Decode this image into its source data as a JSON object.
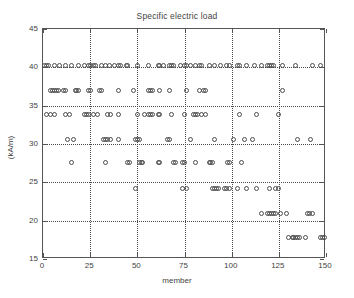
{
  "chart_data": {
    "type": "scatter",
    "title": "Specific electric load",
    "xlabel": "member",
    "ylabel": "(kA/m)",
    "xlim": [
      0,
      150
    ],
    "ylim": [
      15,
      45
    ],
    "xticks": [
      0,
      25,
      50,
      75,
      100,
      125,
      150
    ],
    "yticks": [
      15,
      20,
      25,
      30,
      35,
      40,
      45
    ],
    "grid": true,
    "grid_style": "dotted",
    "legend": null,
    "marker": "open-circle",
    "series": [
      {
        "name": "Specific electric load",
        "points": [
          [
            1,
            40.3
          ],
          [
            2,
            40.3
          ],
          [
            3,
            40.3
          ],
          [
            6,
            40.3
          ],
          [
            9,
            40.3
          ],
          [
            12,
            40.3
          ],
          [
            15,
            40.3
          ],
          [
            19,
            40.3
          ],
          [
            22,
            40.3
          ],
          [
            24,
            40.3
          ],
          [
            25,
            40.3
          ],
          [
            27,
            40.3
          ],
          [
            28,
            40.3
          ],
          [
            31,
            40.3
          ],
          [
            33,
            40.3
          ],
          [
            35,
            40.3
          ],
          [
            38,
            40.3
          ],
          [
            40,
            40.3
          ],
          [
            41,
            40.3
          ],
          [
            44,
            40.3
          ],
          [
            45,
            40.3
          ],
          [
            50,
            40.3
          ],
          [
            56,
            40.3
          ],
          [
            61,
            40.3
          ],
          [
            62,
            40.3
          ],
          [
            64,
            40.3
          ],
          [
            67,
            40.3
          ],
          [
            68,
            40.3
          ],
          [
            69,
            40.3
          ],
          [
            73,
            40.3
          ],
          [
            75,
            40.3
          ],
          [
            76,
            40.3
          ],
          [
            78,
            40.3
          ],
          [
            81,
            40.3
          ],
          [
            83,
            40.3
          ],
          [
            84,
            40.3
          ],
          [
            88,
            40.3
          ],
          [
            91,
            40.3
          ],
          [
            94,
            40.3
          ],
          [
            97,
            40.3
          ],
          [
            99,
            40.3
          ],
          [
            103,
            40.3
          ],
          [
            104,
            40.3
          ],
          [
            108,
            40.3
          ],
          [
            112,
            40.3
          ],
          [
            116,
            40.3
          ],
          [
            119,
            40.3
          ],
          [
            120,
            40.3
          ],
          [
            121,
            40.3
          ],
          [
            122,
            40.3
          ],
          [
            127,
            40.3
          ],
          [
            134,
            40.3
          ],
          [
            143,
            40.3
          ],
          [
            147,
            40.3
          ],
          [
            4,
            37.0
          ],
          [
            5,
            37.0
          ],
          [
            6,
            37.0
          ],
          [
            7,
            37.0
          ],
          [
            8,
            37.0
          ],
          [
            11,
            37.0
          ],
          [
            12,
            37.0
          ],
          [
            17,
            37.0
          ],
          [
            18,
            37.0
          ],
          [
            19,
            37.0
          ],
          [
            24,
            37.0
          ],
          [
            25,
            37.0
          ],
          [
            30,
            37.0
          ],
          [
            31,
            37.0
          ],
          [
            40,
            37.0
          ],
          [
            48,
            37.0
          ],
          [
            56,
            37.0
          ],
          [
            57,
            37.0
          ],
          [
            58,
            37.0
          ],
          [
            62,
            37.0
          ],
          [
            67,
            37.0
          ],
          [
            76,
            37.0
          ],
          [
            83,
            37.0
          ],
          [
            85,
            37.0
          ],
          [
            86,
            37.0
          ],
          [
            127,
            37.0
          ],
          [
            2,
            33.9
          ],
          [
            4,
            33.9
          ],
          [
            6,
            33.9
          ],
          [
            12,
            33.9
          ],
          [
            14,
            33.9
          ],
          [
            22,
            33.9
          ],
          [
            23,
            33.9
          ],
          [
            24,
            33.9
          ],
          [
            27,
            33.9
          ],
          [
            29,
            33.9
          ],
          [
            34,
            33.9
          ],
          [
            36,
            33.9
          ],
          [
            40,
            33.9
          ],
          [
            50,
            33.9
          ],
          [
            54,
            33.9
          ],
          [
            56,
            33.9
          ],
          [
            57,
            33.9
          ],
          [
            58,
            33.9
          ],
          [
            61,
            33.9
          ],
          [
            62,
            33.9
          ],
          [
            68,
            33.9
          ],
          [
            75,
            33.9
          ],
          [
            80,
            33.9
          ],
          [
            81,
            33.9
          ],
          [
            82,
            33.9
          ],
          [
            84,
            33.9
          ],
          [
            86,
            33.9
          ],
          [
            104,
            33.9
          ],
          [
            113,
            33.9
          ],
          [
            125,
            33.9
          ],
          [
            13,
            30.6
          ],
          [
            16,
            30.6
          ],
          [
            32,
            30.6
          ],
          [
            33,
            30.6
          ],
          [
            34,
            30.6
          ],
          [
            36,
            30.6
          ],
          [
            40,
            30.6
          ],
          [
            49,
            30.6
          ],
          [
            50,
            30.6
          ],
          [
            51,
            30.6
          ],
          [
            66,
            30.6
          ],
          [
            67,
            30.6
          ],
          [
            78,
            30.6
          ],
          [
            91,
            30.6
          ],
          [
            101,
            30.6
          ],
          [
            107,
            30.6
          ],
          [
            111,
            30.6
          ],
          [
            135,
            30.6
          ],
          [
            142,
            30.6
          ],
          [
            15,
            27.6
          ],
          [
            33,
            27.6
          ],
          [
            45,
            27.6
          ],
          [
            46,
            27.6
          ],
          [
            51,
            27.6
          ],
          [
            52,
            27.6
          ],
          [
            53,
            27.6
          ],
          [
            61,
            27.6
          ],
          [
            62,
            27.6
          ],
          [
            69,
            27.6
          ],
          [
            70,
            27.6
          ],
          [
            74,
            27.6
          ],
          [
            75,
            27.6
          ],
          [
            81,
            27.6
          ],
          [
            88,
            27.6
          ],
          [
            89,
            27.6
          ],
          [
            90,
            27.6
          ],
          [
            98,
            27.6
          ],
          [
            99,
            27.6
          ],
          [
            105,
            27.6
          ],
          [
            49,
            24.2
          ],
          [
            74,
            24.2
          ],
          [
            76,
            24.2
          ],
          [
            90,
            24.2
          ],
          [
            91,
            24.2
          ],
          [
            92,
            24.2
          ],
          [
            93,
            24.2
          ],
          [
            96,
            24.2
          ],
          [
            97,
            24.2
          ],
          [
            99,
            24.2
          ],
          [
            103,
            24.2
          ],
          [
            108,
            24.2
          ],
          [
            113,
            24.2
          ],
          [
            120,
            24.2
          ],
          [
            123,
            24.2
          ],
          [
            125,
            24.2
          ],
          [
            116,
            21.0
          ],
          [
            119,
            21.0
          ],
          [
            120,
            21.0
          ],
          [
            121,
            21.0
          ],
          [
            122,
            21.0
          ],
          [
            123,
            21.0
          ],
          [
            126,
            21.0
          ],
          [
            129,
            21.0
          ],
          [
            140,
            21.0
          ],
          [
            141,
            21.0
          ],
          [
            143,
            21.0
          ],
          [
            130,
            17.8
          ],
          [
            132,
            17.8
          ],
          [
            133,
            17.8
          ],
          [
            134,
            17.8
          ],
          [
            135,
            17.8
          ],
          [
            136,
            17.8
          ],
          [
            139,
            17.8
          ],
          [
            147,
            17.8
          ],
          [
            148,
            17.8
          ],
          [
            149,
            17.8
          ]
        ]
      }
    ]
  },
  "colors": {
    "background": "#ffffff",
    "axis": "#555555",
    "grid": "#4a4a4a",
    "marker": "#4d4d4d",
    "text": "#3f3f3f"
  }
}
